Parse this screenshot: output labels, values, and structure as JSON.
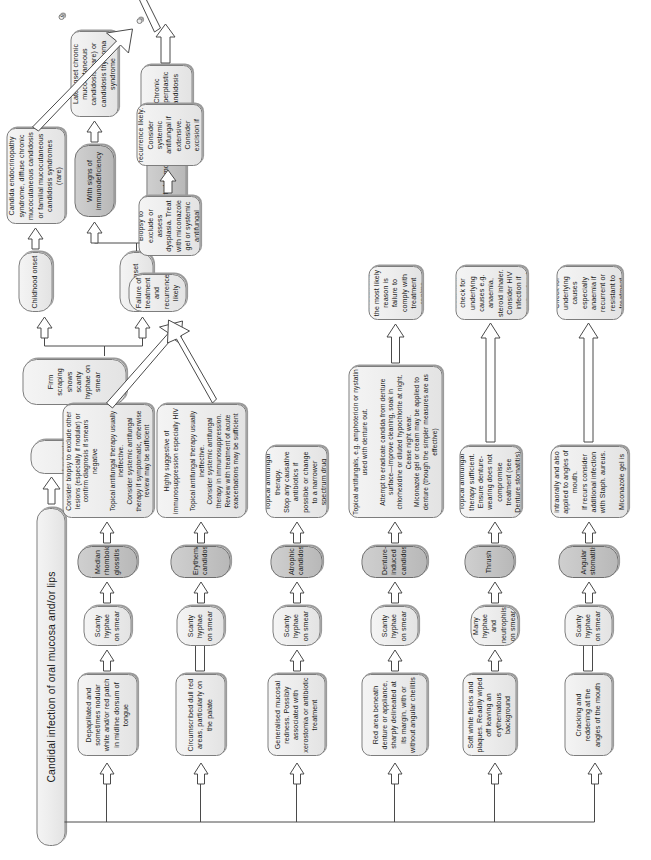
{
  "diagram": {
    "title": "Candidal infection of oral mucosa and/or lips",
    "type": "clinical-decision-flowchart",
    "orientation": "rotated-90-clockwise"
  },
  "root": {
    "label": "Candidal infection of oral mucosa and/or lips"
  },
  "branches": {
    "leukoplakia": {
      "sign": "Leukoplakia-like lesion",
      "smear": "Firm scraping shows scanty hyphae on smear",
      "onset_childhood": "Childhood onset",
      "onset_adult": "Adult onset",
      "childhood_diagnosis": "Candida endocrinopathy syndrome, diffuse chronic mucocutaneous candidosis or familial mucocutaneous candidosis syndromes (rare)",
      "adult_immunodeficiency": "With signs of immunodeficiency",
      "adult_limited": "Limited to mouth",
      "immunodeficiency_diagnosis": "Late-onset chronic mucocutaneous candidosis (rare) or candidosis thymoma syndrome",
      "limited_diagnosis": "Chronic hyperplastic candidosis",
      "limited_treatment": "Biopsy to exclude or assess dysplasia. Treat with miconazole gel or systemic antifungal",
      "limited_outcome": "Failure of treatment and recurrence likely. Consider systemic antifungal if extensive. Consider excision if dysplasia present",
      "resistance_outcome": "Resistance to treatment. Monitor for associated disorders that may require treatment"
    },
    "rows": [
      {
        "sign": "Depapillated and sometimes nodular white and/or red patch in midline dorsum of tongue",
        "smear": "Scanty hyphae on smear",
        "diagnosis": "Median rhomboid glossitis",
        "treatment": "Consider biopsy to exclude other lesions (especially if nodular) or confirm diagnosis if smears negative\n\nTopical antifungal therapy usually ineffective.\nConsider systemic antifungal therapy if symptomatic, otherwise review may be sufficient",
        "outcome": "Failure of treatment and recurrence likely"
      },
      {
        "sign": "Circumscribed dull red areas, particularly on the palate",
        "smear": "Scanty hyphae on smear",
        "diagnosis": "Erythematous candidosis",
        "treatment": "Highly suggestive of immunosuppression especially HIV\n\nTopical antifungal therapy usually ineffective.\nConsider systemic antifungal therapy in immunosuppression. Review with treatment of acute exacerbations may be sufficient",
        "outcome": "Failure of treatment and recurrence likely"
      },
      {
        "sign": "Generalised mucosal redness. Possibly associated with xerostomia or antibiotic treatment",
        "smear": "Scanty hyphae on smear",
        "diagnosis": "Atrophic candidosis",
        "treatment": "Topical antifungal therapy.\nStop any causative antibiotics if possible or change to a narrower spectrum drug",
        "outcome": ""
      },
      {
        "sign": "Red area beneath denture or appliance, sharply delineated at its margin, with or without angular cheilitis",
        "smear": "Scanty hyphae on smear",
        "diagnosis": "Denture-induced candidosis",
        "treatment": "Topical antifungals, e.g. amphotericin or nystatin used with denture out.\n\nAttempt to eradicate candida from denture surface—improve cleaning, soak in chlorhexidine or diluted hypochlorite at night. Cease night wear.\nMiconazole gel or cream may be applied to denture (though the simpler measures are as effective)",
        "outcome": "If recurrent, the most likely reason is failure to comply with treatment regime"
      },
      {
        "sign": "Soft white flecks and plaques. Readily wiped off leaving an erythematous background",
        "smear": "Many hyphae and neutrophils on smear",
        "diagnosis": "Thrush",
        "treatment": "Topical antifungal therapy sufficient. Ensure denture-wearing does not compromise treatment (see Denture stomatitis)",
        "outcome": "If recurrent or resistant to treatment check for underlying causes e.g. anaemia, steroid inhaler. Consider HIV infection if thrush extends to pharynx or oesophagus"
      },
      {
        "sign": "Cracking and reddening at the angles of the mouth",
        "smear": "Scanty hyphae on smear",
        "diagnosis": "Angular stomatitis",
        "treatment": "Topical antifungals intraorally and also applied to angles of mouth.\nIf recurs consider additional infection with Staph. aureus.\n\nMiconazole gel is then indicated",
        "outcome": "Check for underlying causes especially anaemia if recurrent or resistant to treatment"
      }
    ]
  },
  "colors": {
    "node_fill_light": "#ededed",
    "node_fill_dark": "#c4c4c4",
    "node_border": "#7d7d7d",
    "arrow_stroke": "#4a4a4a",
    "arrow_fill": "#ffffff",
    "text": "#1a1a1a",
    "background": "#ffffff"
  }
}
